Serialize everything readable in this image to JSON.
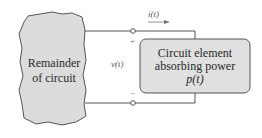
{
  "diagram": {
    "remainder": {
      "line1": "Remainder",
      "line2": "of circuit"
    },
    "element": {
      "line1": "Circuit element",
      "line2": "absorbing power",
      "line3": "p(t)"
    },
    "current_label": "i(t)",
    "voltage_label": "v(t)",
    "plus": "+",
    "minus": "−",
    "colors": {
      "blob_fill": "#dcdcdc",
      "box_fill": "#e0e0e0",
      "stroke": "#555555"
    }
  }
}
